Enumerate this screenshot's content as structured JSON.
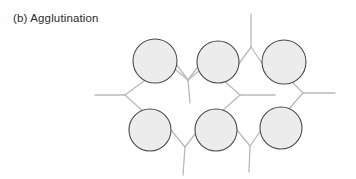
{
  "figure": {
    "caption": "(b) Agglutination",
    "width": 356,
    "height": 179,
    "background_color": "#ffffff"
  },
  "style": {
    "cell_fill": "#ececec",
    "cell_stroke": "#4a4a4a",
    "cell_stroke_width": 1.1,
    "antibody_stroke": "#b9b9b9",
    "antibody_stroke_width": 1.3,
    "caption_color": "#2b2b2b"
  },
  "diagram": {
    "type": "agglutination-lattice",
    "cells": [
      {
        "name": "cell-top-left",
        "cx": 155,
        "cy": 61,
        "r": 22
      },
      {
        "name": "cell-top-middle",
        "cx": 218,
        "cy": 62,
        "r": 21
      },
      {
        "name": "cell-top-right",
        "cx": 284,
        "cy": 62,
        "r": 22
      },
      {
        "name": "cell-bottom-left",
        "cx": 150,
        "cy": 130,
        "r": 21
      },
      {
        "name": "cell-bottom-middle",
        "cx": 216,
        "cy": 130,
        "r": 21
      },
      {
        "name": "cell-bottom-right",
        "cx": 281,
        "cy": 128,
        "r": 21
      }
    ],
    "antibodies": [
      {
        "name": "antibody-top-center-up",
        "orientation": "up",
        "fork": {
          "x": 251,
          "y": 47
        },
        "stem_end": {
          "x": 251,
          "y": 14
        },
        "arm_left_end": {
          "x": 233,
          "y": 72
        },
        "arm_right_end": {
          "x": 268,
          "y": 72
        }
      },
      {
        "name": "antibody-upper-left-down",
        "orientation": "down",
        "fork": {
          "x": 188,
          "y": 80
        },
        "stem_end": {
          "x": 190,
          "y": 103
        },
        "arm_left_end": {
          "x": 170,
          "y": 56
        },
        "arm_right_end": {
          "x": 206,
          "y": 56
        }
      },
      {
        "name": "antibody-left-edge",
        "orientation": "left",
        "fork": {
          "x": 125,
          "y": 95
        },
        "stem_end": {
          "x": 95,
          "y": 95
        },
        "arm_top_end": {
          "x": 148,
          "y": 78
        },
        "arm_bottom_end": {
          "x": 145,
          "y": 113
        }
      },
      {
        "name": "antibody-center-left",
        "orientation": "left",
        "fork": {
          "x": 240,
          "y": 95
        },
        "stem_end": {
          "x": 275,
          "y": 95
        },
        "arm_top_end": {
          "x": 222,
          "y": 79
        },
        "arm_bottom_end": {
          "x": 221,
          "y": 112
        }
      },
      {
        "name": "antibody-right-edge",
        "orientation": "right",
        "fork": {
          "x": 303,
          "y": 93
        },
        "stem_end": {
          "x": 335,
          "y": 93
        },
        "arm_top_end": {
          "x": 288,
          "y": 78
        },
        "arm_bottom_end": {
          "x": 287,
          "y": 111
        }
      },
      {
        "name": "antibody-bottom-left-down",
        "orientation": "down",
        "fork": {
          "x": 185,
          "y": 147
        },
        "stem_end": {
          "x": 183,
          "y": 175
        },
        "arm_left_end": {
          "x": 166,
          "y": 124
        },
        "arm_right_end": {
          "x": 202,
          "y": 125
        }
      },
      {
        "name": "antibody-bottom-right-down",
        "orientation": "down",
        "fork": {
          "x": 250,
          "y": 146
        },
        "stem_end": {
          "x": 249,
          "y": 172
        },
        "arm_left_end": {
          "x": 232,
          "y": 124
        },
        "arm_right_end": {
          "x": 266,
          "y": 123
        }
      },
      {
        "name": "antibody-top-left-outer",
        "orientation": "up",
        "fork": {
          "x": 188,
          "y": 80
        },
        "stem_end": {
          "x": 188,
          "y": 80
        },
        "arm_left_end": {
          "x": 176,
          "y": 70
        },
        "arm_right_end": {
          "x": 200,
          "y": 70
        }
      }
    ]
  }
}
